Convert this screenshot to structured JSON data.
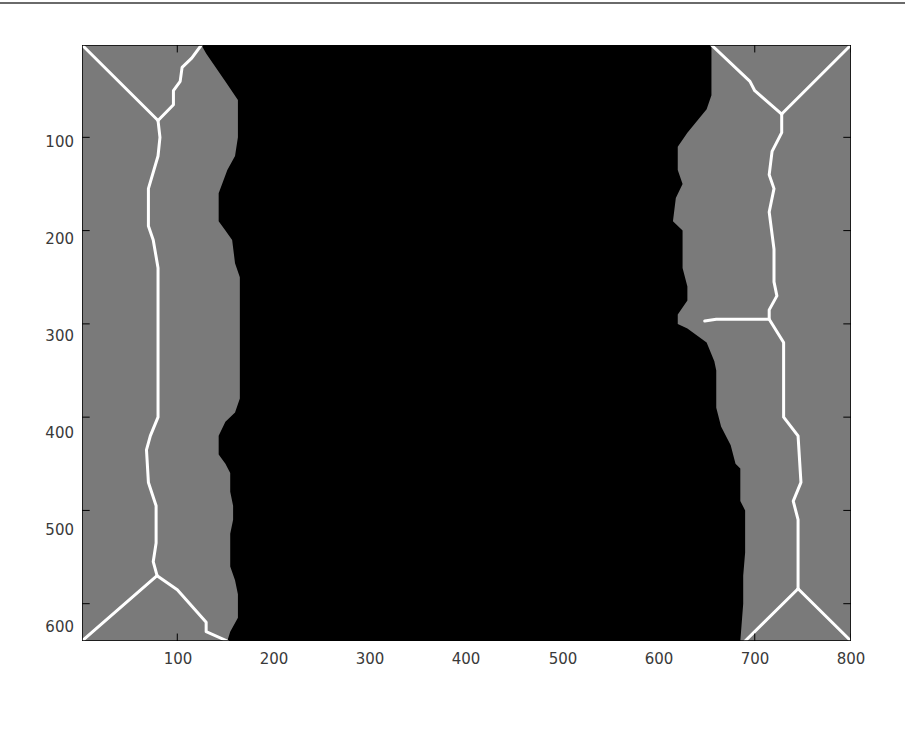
{
  "chart_data": {
    "type": "heatmap",
    "title": "",
    "xlabel": "",
    "ylabel": "",
    "xlim": [
      1,
      800
    ],
    "ylim": [
      1,
      640
    ],
    "y_axis_reversed": true,
    "grid": false,
    "legend": null,
    "x_ticks": [
      100,
      200,
      300,
      400,
      500,
      600,
      700,
      800
    ],
    "x_tick_labels": [
      "100",
      "200",
      "300",
      "400",
      "500",
      "600",
      "700",
      "800"
    ],
    "y_ticks": [
      100,
      200,
      300,
      400,
      500,
      600
    ],
    "y_tick_labels": [
      "100",
      "200",
      "300",
      "400",
      "500",
      "600"
    ],
    "colors": {
      "background_region": "#000000",
      "foreground_region": "#7a7a7a",
      "skeleton": "#ffffff",
      "axes_border": "#000000",
      "tick_label": "#3a3a3a"
    },
    "regions": [
      {
        "name": "left-gray-region",
        "fill": "foreground_region",
        "boundary_right": [
          [
            125,
            1
          ],
          [
            130,
            10
          ],
          [
            150,
            40
          ],
          [
            163,
            60
          ],
          [
            163,
            100
          ],
          [
            160,
            120
          ],
          [
            152,
            135
          ],
          [
            143,
            160
          ],
          [
            143,
            190
          ],
          [
            150,
            200
          ],
          [
            157,
            210
          ],
          [
            160,
            235
          ],
          [
            165,
            250
          ],
          [
            165,
            380
          ],
          [
            160,
            395
          ],
          [
            150,
            405
          ],
          [
            143,
            420
          ],
          [
            143,
            440
          ],
          [
            150,
            450
          ],
          [
            155,
            460
          ],
          [
            155,
            480
          ],
          [
            158,
            495
          ],
          [
            158,
            510
          ],
          [
            155,
            525
          ],
          [
            155,
            560
          ],
          [
            160,
            575
          ],
          [
            163,
            590
          ],
          [
            163,
            615
          ],
          [
            155,
            630
          ],
          [
            152,
            640
          ]
        ]
      },
      {
        "name": "center-black-region",
        "fill": "background_region"
      },
      {
        "name": "right-gray-region",
        "fill": "foreground_region",
        "boundary_left": [
          [
            655,
            1
          ],
          [
            655,
            55
          ],
          [
            650,
            70
          ],
          [
            630,
            95
          ],
          [
            620,
            110
          ],
          [
            620,
            135
          ],
          [
            625,
            150
          ],
          [
            618,
            165
          ],
          [
            615,
            190
          ],
          [
            625,
            200
          ],
          [
            625,
            240
          ],
          [
            630,
            260
          ],
          [
            630,
            275
          ],
          [
            620,
            290
          ],
          [
            620,
            300
          ],
          [
            630,
            305
          ],
          [
            650,
            320
          ],
          [
            658,
            340
          ],
          [
            660,
            350
          ],
          [
            660,
            390
          ],
          [
            665,
            410
          ],
          [
            675,
            430
          ],
          [
            680,
            450
          ],
          [
            685,
            455
          ],
          [
            685,
            490
          ],
          [
            690,
            500
          ],
          [
            690,
            545
          ],
          [
            688,
            570
          ],
          [
            688,
            600
          ],
          [
            685,
            640
          ]
        ]
      }
    ],
    "skeleton_lines": [
      {
        "name": "left-top-left-branch",
        "points": [
          [
            1,
            1
          ],
          [
            80,
            82
          ]
        ]
      },
      {
        "name": "left-top-right-branch",
        "points": [
          [
            125,
            1
          ],
          [
            115,
            15
          ],
          [
            105,
            25
          ],
          [
            103,
            40
          ],
          [
            96,
            50
          ],
          [
            96,
            65
          ],
          [
            80,
            82
          ]
        ]
      },
      {
        "name": "left-spine",
        "points": [
          [
            80,
            82
          ],
          [
            82,
            100
          ],
          [
            80,
            120
          ],
          [
            70,
            155
          ],
          [
            70,
            195
          ],
          [
            75,
            210
          ],
          [
            80,
            240
          ],
          [
            80,
            400
          ],
          [
            72,
            420
          ],
          [
            68,
            435
          ],
          [
            70,
            470
          ],
          [
            78,
            495
          ],
          [
            78,
            535
          ],
          [
            75,
            555
          ],
          [
            79,
            570
          ]
        ]
      },
      {
        "name": "left-bottom-left-branch",
        "points": [
          [
            79,
            570
          ],
          [
            1,
            640
          ]
        ]
      },
      {
        "name": "left-bottom-right-branch",
        "points": [
          [
            79,
            570
          ],
          [
            100,
            585
          ],
          [
            130,
            620
          ],
          [
            130,
            630
          ],
          [
            152,
            640
          ]
        ]
      },
      {
        "name": "right-top-left-branch",
        "points": [
          [
            655,
            1
          ],
          [
            695,
            40
          ],
          [
            700,
            50
          ],
          [
            728,
            75
          ]
        ]
      },
      {
        "name": "right-top-right-branch",
        "points": [
          [
            800,
            1
          ],
          [
            728,
            75
          ]
        ]
      },
      {
        "name": "right-spine",
        "points": [
          [
            728,
            75
          ],
          [
            728,
            95
          ],
          [
            718,
            115
          ],
          [
            715,
            140
          ],
          [
            720,
            155
          ],
          [
            715,
            180
          ],
          [
            720,
            220
          ],
          [
            720,
            255
          ],
          [
            723,
            270
          ],
          [
            715,
            285
          ],
          [
            715,
            295
          ],
          [
            730,
            320
          ],
          [
            730,
            400
          ],
          [
            745,
            420
          ],
          [
            748,
            470
          ],
          [
            740,
            490
          ],
          [
            745,
            510
          ],
          [
            745,
            540
          ],
          [
            745,
            565
          ],
          [
            745,
            584
          ]
        ]
      },
      {
        "name": "right-spur-branch",
        "points": [
          [
            715,
            295
          ],
          [
            660,
            295
          ],
          [
            648,
            297
          ]
        ]
      },
      {
        "name": "right-bottom-left-branch",
        "points": [
          [
            745,
            584
          ],
          [
            690,
            640
          ]
        ]
      },
      {
        "name": "right-bottom-right-branch",
        "points": [
          [
            745,
            584
          ],
          [
            800,
            640
          ]
        ]
      }
    ]
  }
}
